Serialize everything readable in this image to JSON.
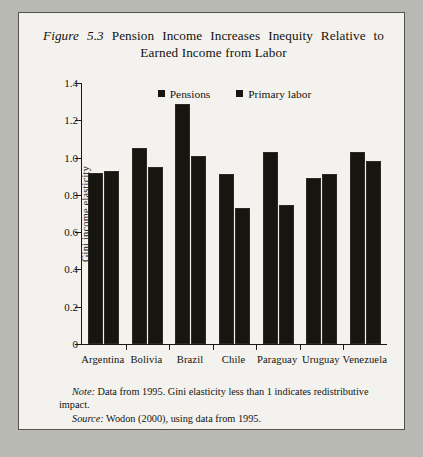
{
  "figure": {
    "label": "Figure 5.3",
    "title_line1": "Pension Income Increases Inequity Relative to",
    "title_line2": "Earned Income from Labor",
    "note_label": "Note:",
    "note_text": " Data from 1995. Gini elasticity less than 1 indicates redistributive impact.",
    "source_label": "Source:",
    "source_text": " Wodon (2000), using data from 1995."
  },
  "chart_data": {
    "type": "bar",
    "title": "Figure 5.3 Pension Income Increases Inequity Relative to Earned Income from Labor",
    "xlabel": "",
    "ylabel": "Gini income elasticity",
    "ylim": [
      0,
      1.4
    ],
    "ytick_labels": [
      "1.4",
      "1.2",
      "1.0",
      "0.8",
      "0.6",
      "0.4",
      "0.2",
      "0"
    ],
    "ytick_values": [
      1.4,
      1.2,
      1.0,
      0.8,
      0.6,
      0.4,
      0.2,
      0
    ],
    "grid": false,
    "legend_position": "top-center",
    "categories": [
      "Argentina",
      "Bolivia",
      "Brazil",
      "Chile",
      "Paraguay",
      "Uruguay",
      "Venezuela"
    ],
    "series": [
      {
        "name": "Pensions",
        "color": "#17150f",
        "values": [
          0.92,
          1.05,
          1.29,
          0.91,
          1.03,
          0.89,
          1.03
        ]
      },
      {
        "name": "Primary labor",
        "color": "#17150f",
        "values": [
          0.93,
          0.95,
          1.01,
          0.73,
          0.745,
          0.91,
          0.98
        ]
      }
    ]
  }
}
